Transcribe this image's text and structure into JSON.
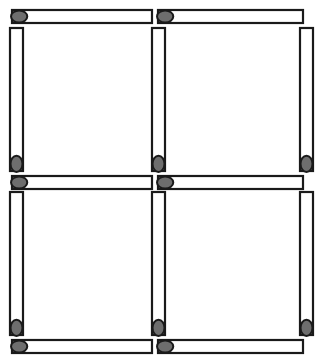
{
  "scene": {
    "title": "Matchstick Grid Puzzle",
    "description": "Twelve matchsticks arranged to form a two-by-two grid of four equal squares",
    "canvas": {
      "width": 323,
      "height": 363,
      "background": "#ffffff"
    },
    "match_count": 12,
    "grid": {
      "rows": 2,
      "cols": 2,
      "squares": 4
    },
    "colors": {
      "stick_fill": "#ffffff",
      "stick_outline": "#1a1a1a",
      "head_fill": "#6e6e6e",
      "head_outline": "#1a1a1a",
      "background": "#ffffff"
    }
  },
  "matches": [
    {
      "id": "match-top-left",
      "label": "Top left horizontal match",
      "orientation": "horizontal",
      "head_end": "left",
      "x": 12,
      "y": 10,
      "length": 140,
      "thickness": 13
    },
    {
      "id": "match-top-right",
      "label": "Top right horizontal match",
      "orientation": "horizontal",
      "head_end": "left",
      "x": 158,
      "y": 10,
      "length": 145,
      "thickness": 13
    },
    {
      "id": "match-left-upper-vertical",
      "label": "Left upper vertical match",
      "orientation": "vertical",
      "head_end": "bottom",
      "x": 10,
      "y": 28,
      "length": 143,
      "thickness": 13
    },
    {
      "id": "match-center-upper-vertical",
      "label": "Center upper vertical match",
      "orientation": "vertical",
      "head_end": "bottom",
      "x": 152,
      "y": 28,
      "length": 143,
      "thickness": 13
    },
    {
      "id": "match-right-upper-vertical",
      "label": "Right upper vertical match",
      "orientation": "vertical",
      "head_end": "bottom",
      "x": 300,
      "y": 28,
      "length": 143,
      "thickness": 13
    },
    {
      "id": "match-middle-left",
      "label": "Middle left horizontal match",
      "orientation": "horizontal",
      "head_end": "left",
      "x": 12,
      "y": 176,
      "length": 140,
      "thickness": 13
    },
    {
      "id": "match-middle-right",
      "label": "Middle right horizontal match",
      "orientation": "horizontal",
      "head_end": "left",
      "x": 158,
      "y": 176,
      "length": 145,
      "thickness": 13
    },
    {
      "id": "match-left-lower-vertical",
      "label": "Left lower vertical match",
      "orientation": "vertical",
      "head_end": "bottom",
      "x": 10,
      "y": 192,
      "length": 143,
      "thickness": 13
    },
    {
      "id": "match-center-lower-vertical",
      "label": "Center lower vertical match",
      "orientation": "vertical",
      "head_end": "bottom",
      "x": 152,
      "y": 192,
      "length": 143,
      "thickness": 13
    },
    {
      "id": "match-right-lower-vertical",
      "label": "Right lower vertical match",
      "orientation": "vertical",
      "head_end": "bottom",
      "x": 300,
      "y": 192,
      "length": 143,
      "thickness": 13
    },
    {
      "id": "match-bottom-left",
      "label": "Bottom left horizontal match",
      "orientation": "horizontal",
      "head_end": "left",
      "x": 12,
      "y": 340,
      "length": 140,
      "thickness": 13
    },
    {
      "id": "match-bottom-right",
      "label": "Bottom right horizontal match",
      "orientation": "horizontal",
      "head_end": "left",
      "x": 158,
      "y": 340,
      "length": 145,
      "thickness": 13
    }
  ]
}
